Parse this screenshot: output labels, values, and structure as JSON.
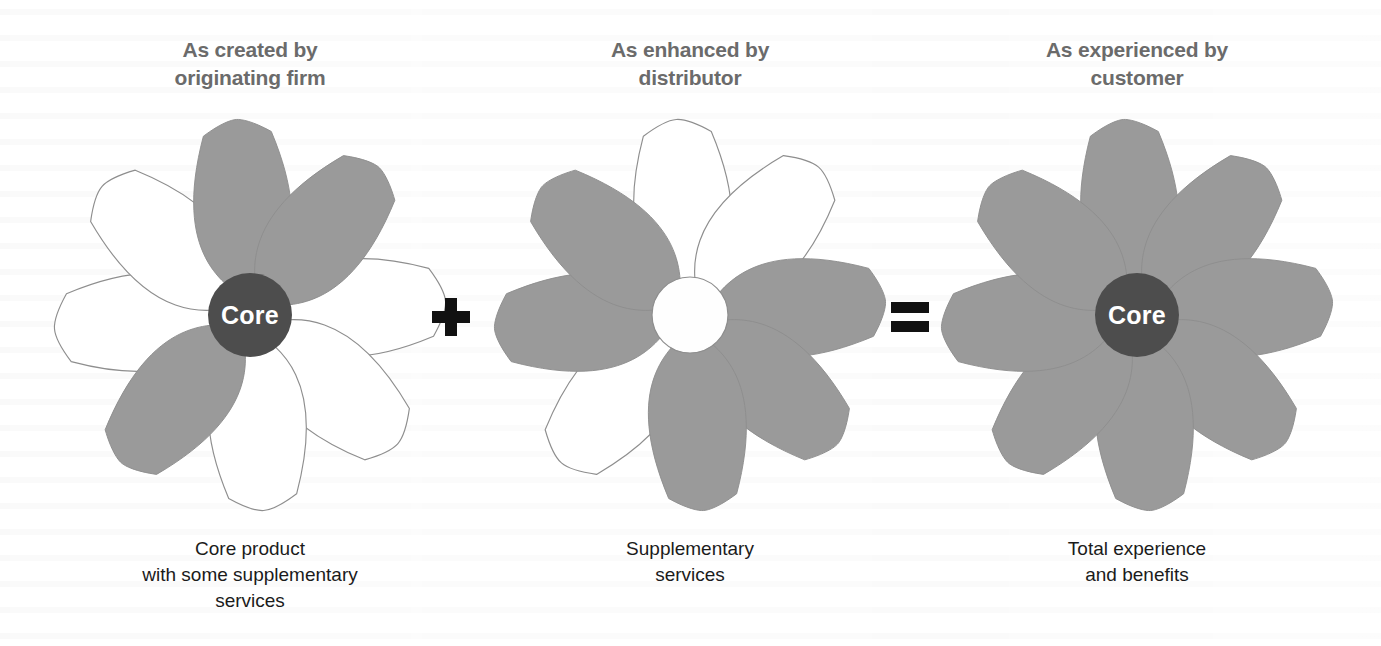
{
  "diagram": {
    "background_color": "#ffffff",
    "petal_fill_gray": "#9a9a9a",
    "petal_fill_white": "#ffffff",
    "petal_outline_color": "#8e8e8e",
    "core_fill_dark": "#4d4d4d",
    "core_fill_white": "#fefefe",
    "core_text_color": "#ffffff",
    "title_text_color": "#6b6b6b",
    "caption_text_color": "#1b1b1b",
    "operator_color": "#111111",
    "petal_count": 8
  },
  "panels": [
    {
      "id": "originating-firm",
      "title": "As created by\noriginating firm",
      "caption": "Core product\nwith some supplementary\nservices",
      "core": {
        "label": "Core",
        "style": "dark",
        "show_label": true,
        "radius": 42
      },
      "petals": [
        {
          "index": 0,
          "angle": 0,
          "position": "top",
          "fill": "gray"
        },
        {
          "index": 1,
          "angle": 45,
          "position": "upper-right",
          "fill": "gray"
        },
        {
          "index": 2,
          "angle": 90,
          "position": "right",
          "fill": "white"
        },
        {
          "index": 3,
          "angle": 135,
          "position": "lower-right",
          "fill": "white"
        },
        {
          "index": 4,
          "angle": 180,
          "position": "bottom",
          "fill": "white"
        },
        {
          "index": 5,
          "angle": 225,
          "position": "lower-left",
          "fill": "gray"
        },
        {
          "index": 6,
          "angle": 270,
          "position": "left",
          "fill": "white"
        },
        {
          "index": 7,
          "angle": 315,
          "position": "upper-left",
          "fill": "white"
        }
      ]
    },
    {
      "id": "distributor",
      "title": "As enhanced by\ndistributor",
      "caption": "Supplementary\nservices",
      "core": {
        "label": "",
        "style": "white",
        "show_label": false,
        "radius": 38
      },
      "petals": [
        {
          "index": 0,
          "angle": 0,
          "position": "top",
          "fill": "white"
        },
        {
          "index": 1,
          "angle": 45,
          "position": "upper-right",
          "fill": "white"
        },
        {
          "index": 2,
          "angle": 90,
          "position": "right",
          "fill": "gray"
        },
        {
          "index": 3,
          "angle": 135,
          "position": "lower-right",
          "fill": "gray"
        },
        {
          "index": 4,
          "angle": 180,
          "position": "bottom",
          "fill": "gray"
        },
        {
          "index": 5,
          "angle": 225,
          "position": "lower-left",
          "fill": "white"
        },
        {
          "index": 6,
          "angle": 270,
          "position": "left",
          "fill": "gray"
        },
        {
          "index": 7,
          "angle": 315,
          "position": "upper-left",
          "fill": "gray"
        }
      ]
    },
    {
      "id": "customer",
      "title": "As experienced by\ncustomer",
      "caption": "Total experience\nand benefits",
      "core": {
        "label": "Core",
        "style": "dark",
        "show_label": true,
        "radius": 42
      },
      "petals": [
        {
          "index": 0,
          "angle": 0,
          "position": "top",
          "fill": "gray"
        },
        {
          "index": 1,
          "angle": 45,
          "position": "upper-right",
          "fill": "gray"
        },
        {
          "index": 2,
          "angle": 90,
          "position": "right",
          "fill": "gray"
        },
        {
          "index": 3,
          "angle": 135,
          "position": "lower-right",
          "fill": "gray"
        },
        {
          "index": 4,
          "angle": 180,
          "position": "bottom",
          "fill": "gray"
        },
        {
          "index": 5,
          "angle": 225,
          "position": "lower-left",
          "fill": "gray"
        },
        {
          "index": 6,
          "angle": 270,
          "position": "left",
          "fill": "gray"
        },
        {
          "index": 7,
          "angle": 315,
          "position": "upper-left",
          "fill": "gray"
        }
      ]
    }
  ],
  "operators": [
    {
      "id": "plus",
      "symbol": "+",
      "meaning": "plus"
    },
    {
      "id": "equals",
      "symbol": "=",
      "meaning": "equals"
    }
  ]
}
